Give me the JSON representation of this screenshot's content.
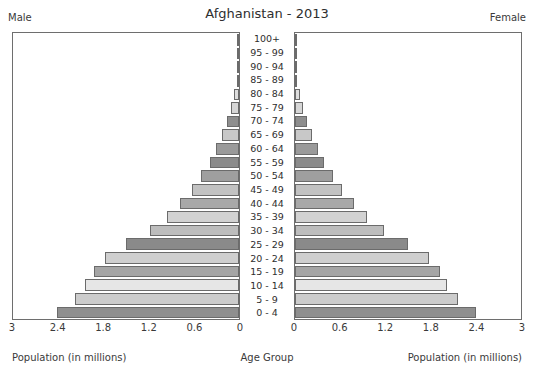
{
  "header": {
    "title": "Afghanistan - 2013",
    "male_label": "Male",
    "female_label": "Female"
  },
  "axes": {
    "male_axis_title": "Population (in millions)",
    "female_axis_title": "Population (in millions)",
    "center_axis_title": "Age Group",
    "tick_labels_male": [
      "3",
      "2.4",
      "1.8",
      "1.2",
      "0.6",
      "0"
    ],
    "tick_labels_female": [
      "0",
      "0.6",
      "1.2",
      "1.8",
      "2.4",
      "3"
    ]
  },
  "chart_data": {
    "type": "bar",
    "title": "Afghanistan - 2013",
    "xlabel": "Population (in millions)",
    "ylabel": "Age Group",
    "xlim": [
      0,
      3
    ],
    "grid": false,
    "orientation": "horizontal-pyramid",
    "categories": [
      "100+",
      "95 - 99",
      "90 - 94",
      "85 - 89",
      "80 - 84",
      "75 - 79",
      "70 - 74",
      "65 - 69",
      "60 - 64",
      "55 - 59",
      "50 - 54",
      "45 - 49",
      "40 - 44",
      "35 - 39",
      "30 - 34",
      "25 - 29",
      "20 - 24",
      "15 - 19",
      "10 - 14",
      "5 - 9",
      "0 - 4"
    ],
    "series": [
      {
        "name": "Male",
        "side": "left",
        "values": [
          0.003,
          0.007,
          0.015,
          0.03,
          0.06,
          0.1,
          0.16,
          0.23,
          0.3,
          0.39,
          0.5,
          0.63,
          0.78,
          0.95,
          1.18,
          1.5,
          1.78,
          1.92,
          2.05,
          2.18,
          2.42
        ]
      },
      {
        "name": "Female",
        "side": "right",
        "values": [
          0.003,
          0.007,
          0.015,
          0.03,
          0.06,
          0.1,
          0.16,
          0.23,
          0.3,
          0.39,
          0.5,
          0.63,
          0.78,
          0.95,
          1.18,
          1.5,
          1.78,
          1.92,
          2.02,
          2.16,
          2.4
        ]
      }
    ],
    "bar_colors": [
      "#f0f0f0",
      "#ededed",
      "#eaeaea",
      "#e4e4e4",
      "#dedede",
      "#d6d6d6",
      "#8e8e8e",
      "#c8c8c8",
      "#9a9a9a",
      "#8b8b8b",
      "#9f9f9f",
      "#c2c2c2",
      "#a8a8a8",
      "#d2d2d2",
      "#bdbdbd",
      "#8a8a8a",
      "#cfcfcf",
      "#a5a5a5",
      "#e6e6e6",
      "#cccccc",
      "#8f8f8f"
    ]
  }
}
